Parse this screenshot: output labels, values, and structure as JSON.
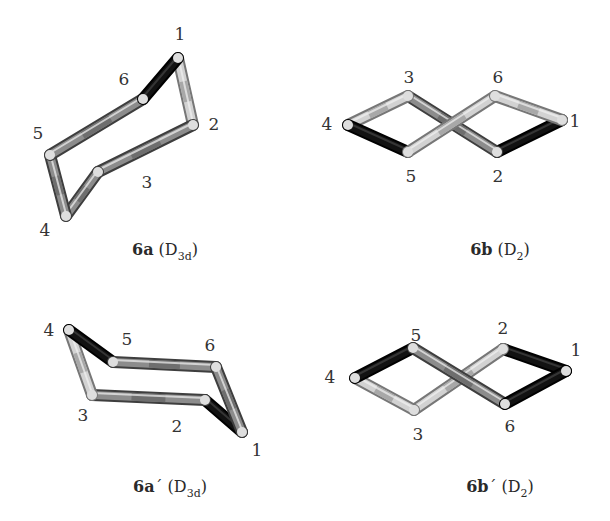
{
  "figure": {
    "colors": {
      "background": "#ffffff",
      "stick_dark": "#111111",
      "stick_mid": "#8a8a8a",
      "stick_light": "#cfcfcf",
      "stick_highlight": "#e6e6e6",
      "label": "#333333"
    },
    "panels": [
      {
        "id": "6a",
        "caption": {
          "compound": "6a",
          "prime": "",
          "group": "D",
          "group_sub": "3d",
          "x": 165,
          "y": 255
        },
        "atoms": [
          {
            "n": "1",
            "x": 178,
            "y": 58,
            "lx": 180,
            "ly": 40
          },
          {
            "n": "2",
            "x": 193,
            "y": 125,
            "lx": 214,
            "ly": 130
          },
          {
            "n": "3",
            "x": 98,
            "y": 172,
            "lx": 147,
            "ly": 188
          },
          {
            "n": "4",
            "x": 66,
            "y": 216,
            "lx": 45,
            "ly": 236
          },
          {
            "n": "5",
            "x": 50,
            "y": 155,
            "lx": 38,
            "ly": 139
          },
          {
            "n": "6",
            "x": 143,
            "y": 99,
            "lx": 124,
            "ly": 85
          }
        ],
        "bonds": [
          {
            "a": 0,
            "b": 1,
            "shade": "light"
          },
          {
            "a": 1,
            "b": 2,
            "shade": "mid"
          },
          {
            "a": 2,
            "b": 3,
            "shade": "mid"
          },
          {
            "a": 3,
            "b": 4,
            "shade": "mid"
          },
          {
            "a": 4,
            "b": 5,
            "shade": "mid"
          },
          {
            "a": 5,
            "b": 0,
            "shade": "dark"
          }
        ]
      },
      {
        "id": "6b",
        "caption": {
          "compound": "6b",
          "prime": "",
          "group": "D",
          "group_sub": "2",
          "x": 500,
          "y": 255
        },
        "atoms": [
          {
            "n": "1",
            "x": 562,
            "y": 120,
            "lx": 575,
            "ly": 127
          },
          {
            "n": "2",
            "x": 497,
            "y": 152,
            "lx": 498,
            "ly": 182
          },
          {
            "n": "3",
            "x": 408,
            "y": 96,
            "lx": 409,
            "ly": 83
          },
          {
            "n": "4",
            "x": 348,
            "y": 125,
            "lx": 327,
            "ly": 130
          },
          {
            "n": "5",
            "x": 408,
            "y": 152,
            "lx": 411,
            "ly": 182
          },
          {
            "n": "6",
            "x": 495,
            "y": 96,
            "lx": 498,
            "ly": 83
          }
        ],
        "bonds": [
          {
            "a": 0,
            "b": 1,
            "shade": "dark"
          },
          {
            "a": 1,
            "b": 2,
            "shade": "mid"
          },
          {
            "a": 2,
            "b": 3,
            "shade": "light"
          },
          {
            "a": 3,
            "b": 4,
            "shade": "dark"
          },
          {
            "a": 4,
            "b": 5,
            "shade": "light"
          },
          {
            "a": 5,
            "b": 0,
            "shade": "light"
          }
        ]
      },
      {
        "id": "6a-prime",
        "caption": {
          "compound": "6a",
          "prime": "´",
          "group": "D",
          "group_sub": "3d",
          "x": 170,
          "y": 492
        },
        "atoms": [
          {
            "n": "1",
            "x": 242,
            "y": 432,
            "lx": 257,
            "ly": 456
          },
          {
            "n": "2",
            "x": 205,
            "y": 400,
            "lx": 177,
            "ly": 432
          },
          {
            "n": "3",
            "x": 92,
            "y": 395,
            "lx": 83,
            "ly": 421
          },
          {
            "n": "4",
            "x": 69,
            "y": 330,
            "lx": 49,
            "ly": 336
          },
          {
            "n": "5",
            "x": 113,
            "y": 362,
            "lx": 127,
            "ly": 345
          },
          {
            "n": "6",
            "x": 216,
            "y": 367,
            "lx": 210,
            "ly": 351
          }
        ],
        "bonds": [
          {
            "a": 0,
            "b": 1,
            "shade": "dark"
          },
          {
            "a": 1,
            "b": 2,
            "shade": "mid"
          },
          {
            "a": 2,
            "b": 3,
            "shade": "light"
          },
          {
            "a": 3,
            "b": 4,
            "shade": "dark"
          },
          {
            "a": 4,
            "b": 5,
            "shade": "mid"
          },
          {
            "a": 5,
            "b": 0,
            "shade": "mid"
          }
        ]
      },
      {
        "id": "6b-prime",
        "caption": {
          "compound": "6b",
          "prime": "´",
          "group": "D",
          "group_sub": "2",
          "x": 500,
          "y": 492
        },
        "atoms": [
          {
            "n": "1",
            "x": 566,
            "y": 371,
            "lx": 576,
            "ly": 356
          },
          {
            "n": "2",
            "x": 503,
            "y": 349,
            "lx": 503,
            "ly": 334
          },
          {
            "n": "3",
            "x": 414,
            "y": 410,
            "lx": 418,
            "ly": 440
          },
          {
            "n": "4",
            "x": 355,
            "y": 378,
            "lx": 330,
            "ly": 383
          },
          {
            "n": "5",
            "x": 413,
            "y": 348,
            "lx": 416,
            "ly": 341
          },
          {
            "n": "6",
            "x": 505,
            "y": 404,
            "lx": 510,
            "ly": 432
          }
        ],
        "bonds": [
          {
            "a": 0,
            "b": 1,
            "shade": "dark"
          },
          {
            "a": 1,
            "b": 2,
            "shade": "light"
          },
          {
            "a": 2,
            "b": 3,
            "shade": "light"
          },
          {
            "a": 3,
            "b": 4,
            "shade": "dark"
          },
          {
            "a": 4,
            "b": 5,
            "shade": "mid"
          },
          {
            "a": 5,
            "b": 0,
            "shade": "dark"
          }
        ]
      }
    ]
  }
}
